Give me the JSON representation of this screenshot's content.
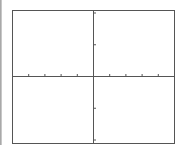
{
  "chart_data": {
    "type": "line",
    "title": "",
    "xlabel": "",
    "ylabel": "",
    "grid": false,
    "legend": null,
    "series": [],
    "x_ticks_count_each_side": 5,
    "y_ticks_count_each_side": 2,
    "xlim": [
      -5,
      5
    ],
    "ylim": [
      -2,
      2
    ],
    "tick_labels": [],
    "note": "Empty Cartesian coordinate plane with axes crossing at origin; no plotted data"
  },
  "colors": {
    "frame": "#555555",
    "axis": "#555555",
    "background": "#ffffff"
  }
}
